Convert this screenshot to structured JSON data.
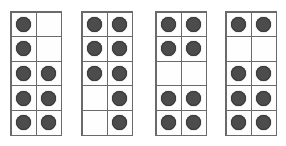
{
  "figure": {
    "background_color": "#ffffff",
    "dot_color": "#4c4c4c",
    "dot_outline_color": "#3a3a3a",
    "grid_line_color": "#6a6a6a",
    "cell_fill_color": "#fefefe",
    "rows": 5,
    "columns": 2,
    "grid_count": 4
  },
  "chart_data": {
    "type": "heatmap",
    "xlabel": "",
    "ylabel": "",
    "grid_rows": 5,
    "grid_columns": 2,
    "legend": [],
    "grids": [
      {
        "name": "grid-1",
        "label": "",
        "x": 10,
        "y": 11,
        "width": 52,
        "height": 125,
        "dot_total": 8,
        "cells": [
          [
            1,
            0
          ],
          [
            1,
            0
          ],
          [
            1,
            1
          ],
          [
            1,
            1
          ],
          [
            1,
            1
          ]
        ]
      },
      {
        "name": "grid-2",
        "label": "",
        "x": 81,
        "y": 11,
        "width": 52,
        "height": 125,
        "dot_total": 8,
        "cells": [
          [
            1,
            1
          ],
          [
            1,
            1
          ],
          [
            1,
            1
          ],
          [
            0,
            1
          ],
          [
            0,
            1
          ]
        ]
      },
      {
        "name": "grid-3",
        "label": "",
        "x": 155,
        "y": 11,
        "width": 52,
        "height": 125,
        "dot_total": 8,
        "cells": [
          [
            1,
            1
          ],
          [
            1,
            1
          ],
          [
            0,
            0
          ],
          [
            1,
            1
          ],
          [
            1,
            1
          ]
        ]
      },
      {
        "name": "grid-4",
        "label": "",
        "x": 225,
        "y": 11,
        "width": 52,
        "height": 125,
        "dot_total": 8,
        "cells": [
          [
            1,
            1
          ],
          [
            0,
            0
          ],
          [
            1,
            1
          ],
          [
            1,
            1
          ],
          [
            1,
            1
          ]
        ]
      }
    ]
  }
}
